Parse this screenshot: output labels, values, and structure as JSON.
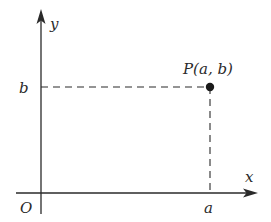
{
  "diagram": {
    "colors": {
      "stroke": "#2a2a2a",
      "background": "#ffffff"
    },
    "labels": {
      "x_axis": "x",
      "y_axis": "y",
      "origin": "O",
      "x_coord": "a",
      "y_coord": "b",
      "point": "P(a, b)"
    },
    "geometry": {
      "origin_px": [
        41,
        193
      ],
      "point_px": [
        210,
        87
      ],
      "x_axis_range_px": [
        16,
        258
      ],
      "y_axis_range_px": [
        10,
        214
      ]
    }
  }
}
